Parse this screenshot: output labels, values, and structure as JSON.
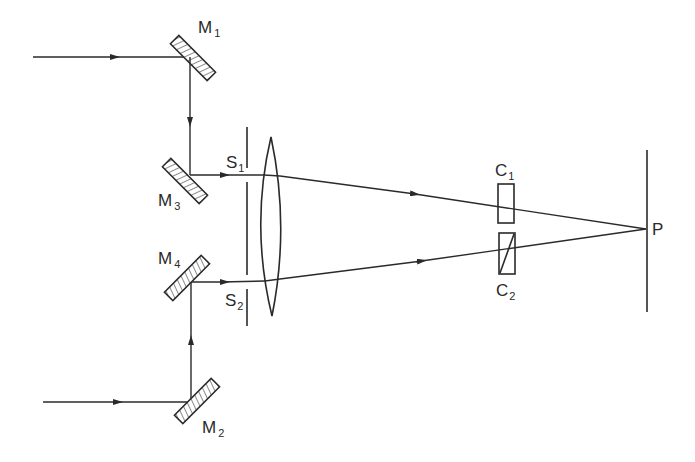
{
  "diagram": {
    "type": "optical-setup",
    "mirrors": [
      {
        "id": "M1",
        "label": "M",
        "sub": "1"
      },
      {
        "id": "M2",
        "label": "M",
        "sub": "2"
      },
      {
        "id": "M3",
        "label": "M",
        "sub": "3"
      },
      {
        "id": "M4",
        "label": "M",
        "sub": "4"
      }
    ],
    "slits": [
      {
        "id": "S1",
        "label": "S",
        "sub": "1"
      },
      {
        "id": "S2",
        "label": "S",
        "sub": "2"
      }
    ],
    "cells": [
      {
        "id": "C1",
        "label": "C",
        "sub": "1"
      },
      {
        "id": "C2",
        "label": "C",
        "sub": "2"
      }
    ],
    "point": {
      "id": "P",
      "label": "P"
    },
    "lens": {
      "id": "lens",
      "type": "biconvex"
    },
    "screen": {
      "id": "screen"
    }
  },
  "colors": {
    "ink": "#2a2a2a",
    "background": "#ffffff"
  }
}
